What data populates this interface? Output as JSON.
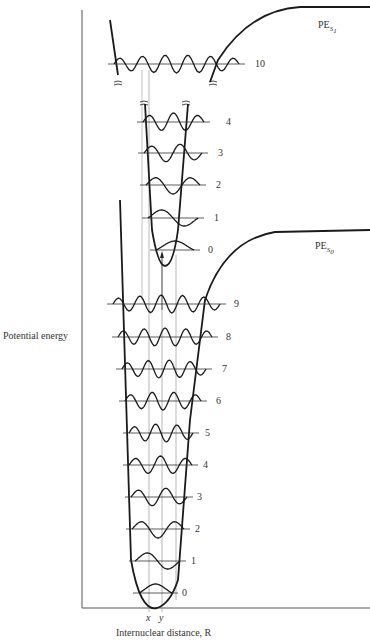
{
  "axes": {
    "ylabel": "Potential energy",
    "xlabel": "Internuclear distance, R",
    "x_ticks": [
      {
        "label": "x",
        "x": 149
      },
      {
        "label": "y",
        "x": 162
      }
    ]
  },
  "curves": {
    "upper": {
      "label_main": "PE",
      "label_sub": "S",
      "label_subsub": "1"
    },
    "lower": {
      "label_main": "PE",
      "label_sub": "S",
      "label_subsub": "0"
    }
  },
  "colors": {
    "curve": "#1a1a1a",
    "guide": "#9a9a9a",
    "text": "#333333"
  },
  "upper_levels": [
    {
      "v": "10",
      "y": 64,
      "x1": 108,
      "x2": 245,
      "label_x": 255,
      "nodes": 10
    },
    {
      "v": "4",
      "y": 122,
      "x1": 137,
      "x2": 210,
      "label_x": 226,
      "nodes": 4
    },
    {
      "v": "3",
      "y": 153,
      "x1": 138,
      "x2": 208,
      "label_x": 218,
      "nodes": 3
    },
    {
      "v": "2",
      "y": 185,
      "x1": 140,
      "x2": 206,
      "label_x": 216,
      "nodes": 2
    },
    {
      "v": "1",
      "y": 218,
      "x1": 142,
      "x2": 204,
      "label_x": 214,
      "nodes": 1
    },
    {
      "v": "0",
      "y": 250,
      "x1": 150,
      "x2": 200,
      "label_x": 208,
      "nodes": 0
    }
  ],
  "lower_levels": [
    {
      "v": "9",
      "y": 304,
      "x1": 107,
      "x2": 226,
      "label_x": 234,
      "nodes": 9
    },
    {
      "v": "8",
      "y": 337,
      "x1": 112,
      "x2": 218,
      "label_x": 226,
      "nodes": 8
    },
    {
      "v": "7",
      "y": 369,
      "x1": 116,
      "x2": 212,
      "label_x": 222,
      "nodes": 7
    },
    {
      "v": "6",
      "y": 401,
      "x1": 119,
      "x2": 207,
      "label_x": 216,
      "nodes": 6
    },
    {
      "v": "5",
      "y": 433,
      "x1": 123,
      "x2": 199,
      "label_x": 205,
      "nodes": 5
    },
    {
      "v": "4",
      "y": 465,
      "x1": 123,
      "x2": 198,
      "label_x": 203,
      "nodes": 4
    },
    {
      "v": "3",
      "y": 497,
      "x1": 125,
      "x2": 193,
      "label_x": 197,
      "nodes": 3
    },
    {
      "v": "2",
      "y": 529,
      "x1": 126,
      "x2": 190,
      "label_x": 195,
      "nodes": 2
    },
    {
      "v": "1",
      "y": 561,
      "x1": 129,
      "x2": 186,
      "label_x": 191,
      "nodes": 1
    },
    {
      "v": "0",
      "y": 593,
      "x1": 133,
      "x2": 178,
      "label_x": 182,
      "nodes": 0
    }
  ]
}
